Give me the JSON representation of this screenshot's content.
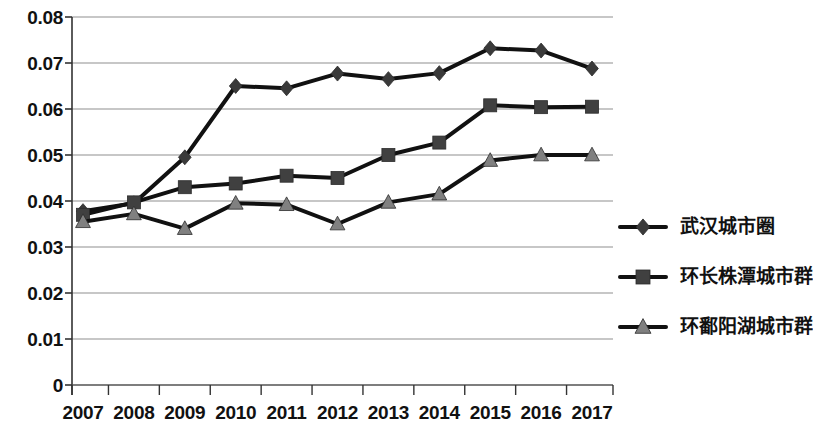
{
  "chart_data": {
    "type": "line",
    "title": "",
    "subtitle": "",
    "xlabel": "",
    "ylabel": "",
    "categories": [
      "2007",
      "2008",
      "2009",
      "2010",
      "2011",
      "2012",
      "2013",
      "2014",
      "2015",
      "2016",
      "2017"
    ],
    "ylim": [
      0,
      0.08
    ],
    "ytick_labels": [
      "0",
      "0.01",
      "0.02",
      "0.03",
      "0.04",
      "0.05",
      "0.06",
      "0.07",
      "0.08"
    ],
    "ytick_values": [
      0,
      0.01,
      0.02,
      0.03,
      0.04,
      0.05,
      0.06,
      0.07,
      0.08
    ],
    "grid": true,
    "grid_axis": "y",
    "legend_position": "right",
    "series": [
      {
        "name": "武汉城市圈",
        "marker": "diamond",
        "color": "#3a3a3a",
        "line_color": "#111111",
        "values": [
          0.0378,
          0.0395,
          0.0495,
          0.065,
          0.0645,
          0.0677,
          0.0665,
          0.0678,
          0.0732,
          0.0727,
          0.0688
        ]
      },
      {
        "name": "环长株潭城市群",
        "marker": "square",
        "color": "#404040",
        "line_color": "#111111",
        "values": [
          0.037,
          0.0397,
          0.043,
          0.0438,
          0.0455,
          0.045,
          0.05,
          0.0527,
          0.0608,
          0.0604,
          0.0605
        ]
      },
      {
        "name": "环鄱阳湖城市群",
        "marker": "triangle",
        "color": "#808080",
        "line_color": "#111111",
        "values": [
          0.0355,
          0.0372,
          0.034,
          0.0395,
          0.0392,
          0.035,
          0.0397,
          0.0415,
          0.0488,
          0.05,
          0.05
        ]
      }
    ]
  },
  "legend": {
    "items": [
      {
        "label": "武汉城市圈",
        "marker": "diamond-marker-icon"
      },
      {
        "label": "环长株潭城市群",
        "marker": "square-marker-icon"
      },
      {
        "label": "环鄱阳湖城市群",
        "marker": "triangle-marker-icon"
      }
    ]
  },
  "axes": {
    "y_labels": [
      "0.08",
      "0.07",
      "0.06",
      "0.05",
      "0.04",
      "0.03",
      "0.02",
      "0.01",
      "0"
    ],
    "x_labels": [
      "2007",
      "2008",
      "2009",
      "2010",
      "2011",
      "2012",
      "2013",
      "2014",
      "2015",
      "2016",
      "2017"
    ]
  }
}
